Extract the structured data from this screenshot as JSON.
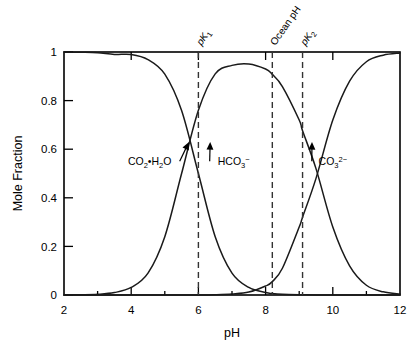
{
  "chart_data": {
    "type": "line",
    "title": "",
    "xlabel": "pH",
    "ylabel": "Mole Fraction",
    "xlim": [
      2,
      12
    ],
    "ylim": [
      0,
      1
    ],
    "grid": false,
    "legend": "none (inline annotations with arrows)",
    "xticks": [
      "2",
      "4",
      "6",
      "8",
      "10",
      "12"
    ],
    "xtick_values": [
      2,
      4,
      6,
      8,
      10,
      12
    ],
    "xminor_values": [
      3,
      5,
      7,
      9,
      11
    ],
    "yticks": [
      "0",
      "0.2",
      "0.4",
      "0.6",
      "0.8",
      "1"
    ],
    "ytick_values": [
      0,
      0.2,
      0.4,
      0.6,
      0.8,
      1
    ],
    "x": [
      2.0,
      2.5,
      3.0,
      3.5,
      4.0,
      4.5,
      5.0,
      5.5,
      6.0,
      6.5,
      7.0,
      7.5,
      8.0,
      8.2,
      8.5,
      9.0,
      9.1,
      9.5,
      10.0,
      10.5,
      11.0,
      11.5,
      12.0
    ],
    "series": [
      {
        "name": "CO2·H2O",
        "label": "CO₂•H₂O",
        "values": [
          1.0,
          0.999,
          0.997,
          0.99,
          0.99,
          0.969,
          0.909,
          0.759,
          0.5,
          0.24,
          0.09,
          0.031,
          0.01,
          0.006,
          0.003,
          0.001,
          0.001,
          0.0,
          0.0,
          0.0,
          0.0,
          0.0,
          0.0
        ]
      },
      {
        "name": "HCO3-",
        "label": "HCO₃⁻",
        "values": [
          0.0,
          0.001,
          0.003,
          0.01,
          0.031,
          0.09,
          0.24,
          0.5,
          0.76,
          0.91,
          0.945,
          0.951,
          0.93,
          0.908,
          0.858,
          0.72,
          0.676,
          0.52,
          0.28,
          0.12,
          0.04,
          0.013,
          0.004
        ]
      },
      {
        "name": "CO3 2-",
        "label": "CO₃²⁻",
        "values": [
          0.0,
          0.0,
          0.0,
          0.0,
          0.0,
          0.0,
          0.0,
          0.0,
          0.0,
          0.001,
          0.004,
          0.012,
          0.037,
          0.055,
          0.11,
          0.28,
          0.32,
          0.48,
          0.72,
          0.88,
          0.96,
          0.987,
          0.996
        ]
      }
    ],
    "vertical_markers": [
      {
        "name": "pK1",
        "label_main": "pK",
        "label_sub": "1",
        "x": 6.0
      },
      {
        "name": "Ocean pH",
        "label_main": "Ocean pH",
        "label_sub": "",
        "x": 8.2
      },
      {
        "name": "pK2",
        "label_main": "pK",
        "label_sub": "2",
        "x": 9.1
      }
    ],
    "annotations": [
      {
        "name": "co2-h2o-annotation",
        "text_main": "CO",
        "sub1": "2",
        "mid": "•H",
        "sub2": "2",
        "tail": "O",
        "x": 4.55,
        "y": 0.55,
        "arrow_to_x": 5.72,
        "arrow_to_y": 0.63
      },
      {
        "name": "hco3-annotation",
        "text_main": "HCO",
        "sub1": "3",
        "sup": "−",
        "x": 7.05,
        "y": 0.55,
        "arrow_to_x": 6.35,
        "arrow_to_y": 0.63
      },
      {
        "name": "co32-annotation",
        "text_main": "CO",
        "sub1": "3",
        "sup": "2−",
        "x": 10.0,
        "y": 0.55,
        "arrow_to_x": 9.38,
        "arrow_to_y": 0.63
      }
    ]
  }
}
